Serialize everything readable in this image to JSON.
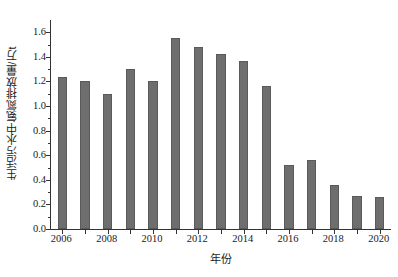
{
  "chart_data": {
    "type": "bar",
    "title": "",
    "subtitle": "",
    "xlabel": "年份",
    "ylabel": "生活污水中氨氮排放量/万t",
    "categories": [
      "2006",
      "2007",
      "2008",
      "2009",
      "2010",
      "2011",
      "2012",
      "2013",
      "2014",
      "2015",
      "2016",
      "2017",
      "2018",
      "2019",
      "2020"
    ],
    "values": [
      1.24,
      1.2,
      1.1,
      1.3,
      1.2,
      1.55,
      1.48,
      1.42,
      1.37,
      1.16,
      0.52,
      0.56,
      0.36,
      0.27,
      0.26
    ],
    "series": [
      {
        "name": "生活污水中氨氮排放量",
        "values": [
          1.24,
          1.2,
          1.1,
          1.3,
          1.2,
          1.55,
          1.48,
          1.42,
          1.37,
          1.16,
          0.52,
          0.56,
          0.36,
          0.27,
          0.26
        ]
      }
    ],
    "ylim": [
      0.0,
      1.7
    ],
    "y_major_ticks": [
      0.0,
      0.2,
      0.4,
      0.6,
      0.8,
      1.0,
      1.2,
      1.4,
      1.6
    ],
    "y_tick_labels": [
      "0.0",
      "0.2",
      "0.4",
      "0.6",
      "0.8",
      "1.0",
      "1.2",
      "1.4",
      "1.6"
    ],
    "y_minor_tick_step": 0.1,
    "x_tick_labels": [
      "2006",
      "2008",
      "2010",
      "2012",
      "2014",
      "2016",
      "2018",
      "2020"
    ],
    "x_tick_categories": [
      "2006",
      "2008",
      "2010",
      "2012",
      "2014",
      "2016",
      "2018",
      "2020"
    ],
    "grid": false,
    "legend": null,
    "legend_position": "none",
    "bar_color": "#6e6e6e",
    "bar_edge_color": "#5a5a5a",
    "axis_color": "#333333",
    "background_color": "#ffffff",
    "annotations": []
  }
}
